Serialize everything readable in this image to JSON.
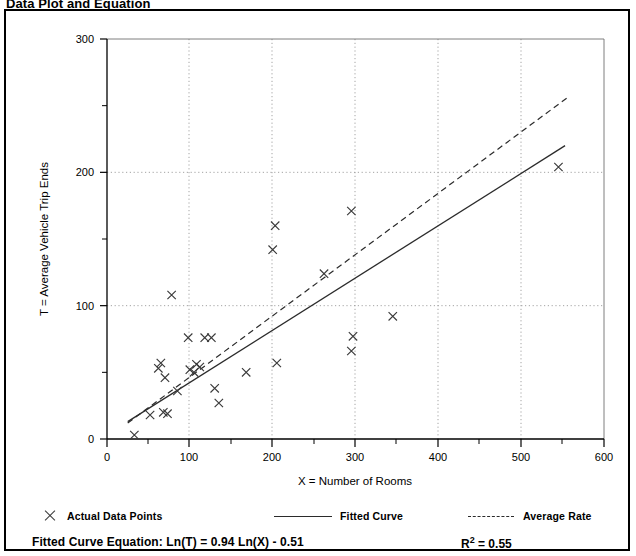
{
  "title": "Data Plot and Equation",
  "legend": {
    "actual_points": "Actual Data Points",
    "fitted_curve": "Fitted Curve",
    "average_rate": "Average Rate"
  },
  "equation": {
    "label": "Fitted Curve Equation:",
    "formula": "Ln(T) = 0.94 Ln(X) - 0.51",
    "full": "Fitted Curve Equation:  Ln(T) = 0.94 Ln(X) - 0.51",
    "r_squared_symbol": "R",
    "r_squared_exponent": "2",
    "r_squared_value": "= 0.55",
    "r_squared_full": "R2 = 0.55"
  },
  "colors": {
    "axis": "#000000",
    "marker": "#3a3a3a",
    "fitted_line": "#2b2b2b",
    "average_line": "#2b2b2b",
    "grid": "#9a9a9a",
    "frame": "#000000",
    "background": "#ffffff"
  },
  "chart_data": {
    "type": "scatter",
    "title": "Data Plot and Equation",
    "xlabel": "X = Number of Rooms",
    "ylabel": "T = Average Vehicle Trip Ends",
    "xlim": [
      0,
      600
    ],
    "ylim": [
      0,
      300
    ],
    "xticks": [
      0,
      100,
      200,
      300,
      400,
      500,
      600
    ],
    "yticks": [
      0,
      100,
      200,
      300
    ],
    "x_minor_ticks": [
      50,
      150,
      250,
      350,
      450,
      550
    ],
    "y_minor_ticks": [
      50,
      150,
      250
    ],
    "grid": "dotted at major ticks inside plot",
    "legend_position": "below plot",
    "series": [
      {
        "name": "Actual Data Points",
        "type": "scatter",
        "marker": "x",
        "points": [
          [
            33,
            3
          ],
          [
            52,
            18
          ],
          [
            62,
            53
          ],
          [
            65,
            57
          ],
          [
            68,
            20
          ],
          [
            70,
            46
          ],
          [
            73,
            19
          ],
          [
            78,
            108
          ],
          [
            85,
            36
          ],
          [
            98,
            76
          ],
          [
            100,
            52
          ],
          [
            105,
            50
          ],
          [
            108,
            56
          ],
          [
            112,
            54
          ],
          [
            118,
            76
          ],
          [
            126,
            76
          ],
          [
            130,
            38
          ],
          [
            135,
            27
          ],
          [
            168,
            50
          ],
          [
            200,
            142
          ],
          [
            203,
            160
          ],
          [
            205,
            57
          ],
          [
            262,
            124
          ],
          [
            295,
            171
          ],
          [
            295,
            66
          ],
          [
            297,
            77
          ],
          [
            345,
            92
          ],
          [
            545,
            204
          ]
        ]
      },
      {
        "name": "Fitted Curve",
        "type": "line",
        "style": "solid",
        "equation": "Ln(T) = 0.94 Ln(X) - 0.51",
        "r_squared": 0.55,
        "endpoints": [
          [
            25,
            13
          ],
          [
            553,
            220
          ]
        ]
      },
      {
        "name": "Average Rate",
        "type": "line",
        "style": "dashed",
        "endpoints": [
          [
            25,
            12
          ],
          [
            558,
            257
          ]
        ]
      }
    ]
  },
  "axes": {
    "x_title": "X = Number of Rooms",
    "y_title": "T = Average Vehicle Trip Ends",
    "x_tick_labels": [
      "0",
      "100",
      "200",
      "300",
      "400",
      "500",
      "600"
    ],
    "y_tick_labels": [
      "0",
      "100",
      "200",
      "300"
    ]
  }
}
